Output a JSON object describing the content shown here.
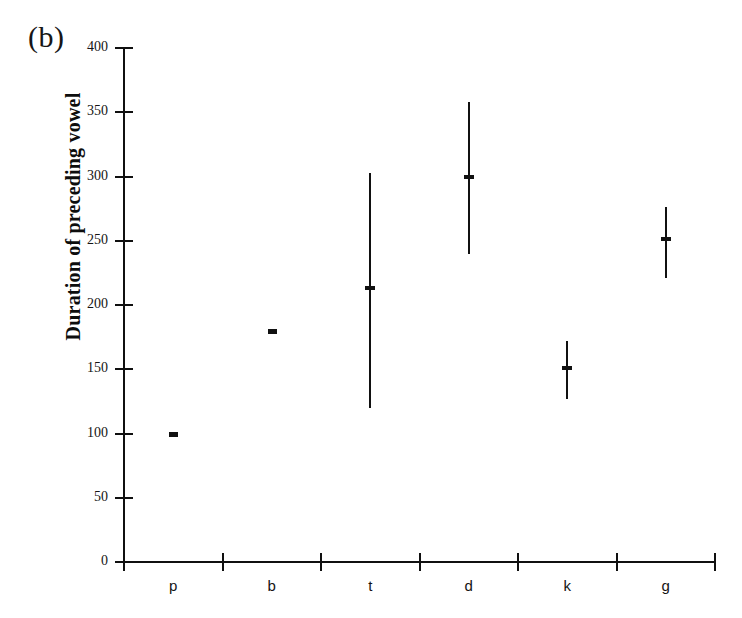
{
  "figure": {
    "panel_label": "(b)"
  },
  "chart_data": {
    "type": "bar",
    "title": "",
    "subtitle": "",
    "xlabel": "",
    "ylabel": "Duration of preceding vowel",
    "categories": [
      "p",
      "b",
      "t",
      "d",
      "k",
      "g"
    ],
    "values": [
      100,
      180,
      213,
      300,
      151,
      251
    ],
    "ranges": [
      {
        "category": "p",
        "min": 100,
        "max": 100,
        "median": 100
      },
      {
        "category": "b",
        "min": 180,
        "max": 180,
        "median": 180
      },
      {
        "category": "t",
        "min": 120,
        "max": 303,
        "median": 213
      },
      {
        "category": "d",
        "min": 240,
        "max": 358,
        "median": 300
      },
      {
        "category": "k",
        "min": 127,
        "max": 172,
        "median": 151
      },
      {
        "category": "g",
        "min": 221,
        "max": 276,
        "median": 251
      }
    ],
    "ylim": [
      0,
      400
    ],
    "yticks": [
      0,
      50,
      100,
      150,
      200,
      250,
      300,
      350,
      400
    ],
    "ytick_labels": [
      "0",
      "50",
      "100",
      "150",
      "200",
      "250",
      "300",
      "350",
      "400"
    ],
    "xtick_labels": [
      "p",
      "b",
      "t",
      "d",
      "k",
      "g"
    ],
    "grid": false,
    "legend": false,
    "legend_position": "none",
    "line_color": "#111111",
    "axis_color": "#101010"
  }
}
